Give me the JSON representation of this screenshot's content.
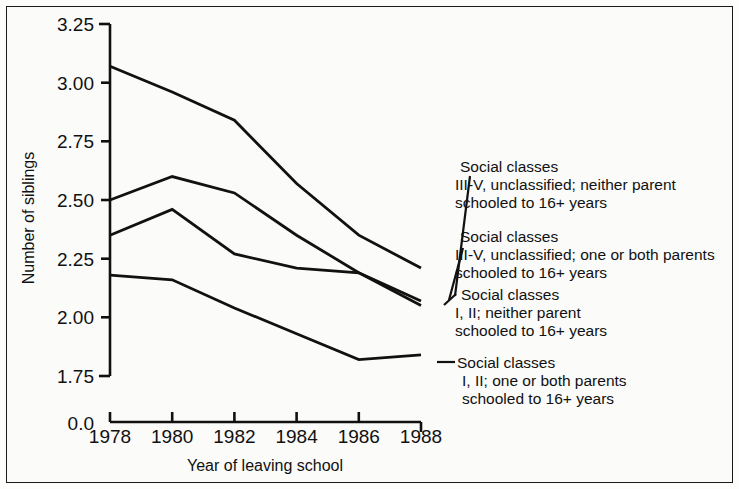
{
  "chart_data": {
    "type": "line",
    "title": "",
    "xlabel": "Year of leaving school",
    "ylabel": "Number of siblings",
    "x": [
      1978,
      1980,
      1982,
      1984,
      1986,
      1988
    ],
    "xtick_labels": [
      "1978",
      "1980",
      "1982",
      "1984",
      "1986",
      "1988"
    ],
    "ytick_labels": [
      "3.25",
      "3.00",
      "2.75",
      "2.50",
      "2.25",
      "2.00",
      "1.75"
    ],
    "ytick_values": [
      3.25,
      3.0,
      2.75,
      2.5,
      2.25,
      2.0,
      1.75
    ],
    "axis_break_label": "0.0",
    "ylim": [
      1.75,
      3.25
    ],
    "grid": false,
    "legend_position": "right",
    "series": [
      {
        "name": "Social classes III-V, unclassified; neither parent schooled to 16+ years",
        "label_lines": [
          "Social classes",
          "III-V, unclassified; neither parent",
          "schooled to 16+ years"
        ],
        "values": [
          3.07,
          2.96,
          2.84,
          2.57,
          2.35,
          2.21
        ]
      },
      {
        "name": "Social classes III-V, unclassified; one or both parents schooled to 16+ years",
        "label_lines": [
          "Social classes",
          "III-V, unclassified; one or both parents",
          "schooled to 16+ years"
        ],
        "values": [
          2.5,
          2.6,
          2.53,
          2.35,
          2.19,
          2.07
        ]
      },
      {
        "name": "Social classes I, II; neither parent schooled to 16+ years",
        "label_lines": [
          "Social classes",
          "I, II; neither parent",
          "schooled to 16+ years"
        ],
        "values": [
          2.35,
          2.46,
          2.27,
          2.21,
          2.19,
          2.05
        ]
      },
      {
        "name": "Social classes I, II; one or both parents schooled to 16+ years",
        "label_lines": [
          "Social classes",
          "I, II; one or both parents",
          "schooled to 16+ years"
        ],
        "values": [
          2.18,
          2.16,
          2.04,
          1.93,
          1.82,
          1.84
        ]
      }
    ]
  },
  "axes": {
    "y_label": "Number of siblings",
    "x_label": "Year of leaving school",
    "break_label": "0.0",
    "y_ticks": [
      "3.25",
      "3.00",
      "2.75",
      "2.50",
      "2.25",
      "2.00",
      "1.75"
    ],
    "x_ticks": [
      "1978",
      "1980",
      "1982",
      "1984",
      "1986",
      "1988"
    ]
  },
  "legend": {
    "entries": [
      {
        "line1": "Social classes",
        "line2": "III-V, unclassified; neither parent",
        "line3": "schooled to 16+ years"
      },
      {
        "line1": "Social classes",
        "line2": "III-V, unclassified; one or both parents",
        "line3": "schooled to 16+ years"
      },
      {
        "line1": "Social classes",
        "line2": "I, II; neither parent",
        "line3": "schooled to 16+ years"
      },
      {
        "line1": "Social classes",
        "line2": "I, II; one or both parents",
        "line3": "schooled to 16+ years"
      }
    ]
  },
  "style": {
    "line_color": "#111111",
    "background": "#fbfbfa",
    "border_color": "#1a1a1a"
  }
}
